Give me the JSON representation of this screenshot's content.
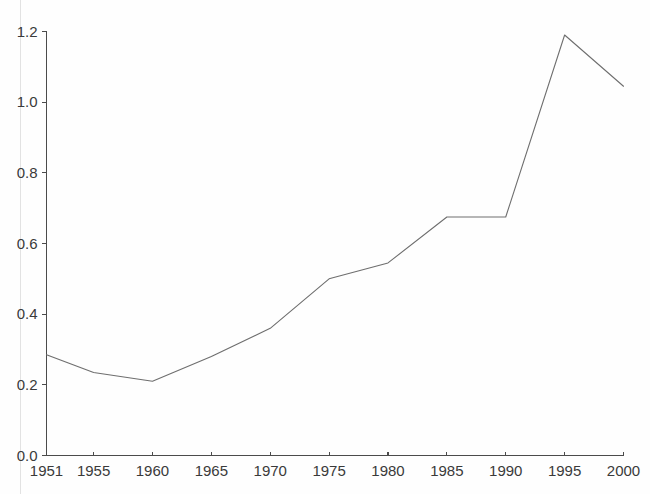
{
  "chart_data": {
    "type": "line",
    "title": "",
    "subtitle": "",
    "xlabel": "",
    "ylabel": "",
    "x": [
      1951,
      1955,
      1960,
      1965,
      1970,
      1975,
      1980,
      1985,
      1990,
      1995,
      2000
    ],
    "values": [
      0.285,
      0.235,
      0.21,
      0.28,
      0.36,
      0.5,
      0.545,
      0.675,
      0.675,
      1.19,
      1.045
    ],
    "series": [
      {
        "name": "series-1",
        "values": [
          0.285,
          0.235,
          0.21,
          0.28,
          0.36,
          0.5,
          0.545,
          0.675,
          0.675,
          1.19,
          1.045
        ]
      }
    ],
    "x_tick_labels": [
      "1951",
      "1955",
      "1960",
      "1965",
      "1970",
      "1975",
      "1980",
      "1985",
      "1990",
      "1995",
      "2000"
    ],
    "y_tick_labels": [
      "0.0",
      "0.2",
      "0.4",
      "0.6",
      "0.8",
      "1.0",
      "1.2"
    ],
    "y_tick_values": [
      0.0,
      0.2,
      0.4,
      0.6,
      0.8,
      1.0,
      1.2
    ],
    "xlim": [
      1951,
      2000
    ],
    "ylim": [
      0.0,
      1.2
    ],
    "grid": false,
    "legend": false,
    "legend_position": "none",
    "annotations": [],
    "line_color": "#6e6e6e",
    "axis_color": "#4b4b4b",
    "background_color": "#fefefe"
  }
}
